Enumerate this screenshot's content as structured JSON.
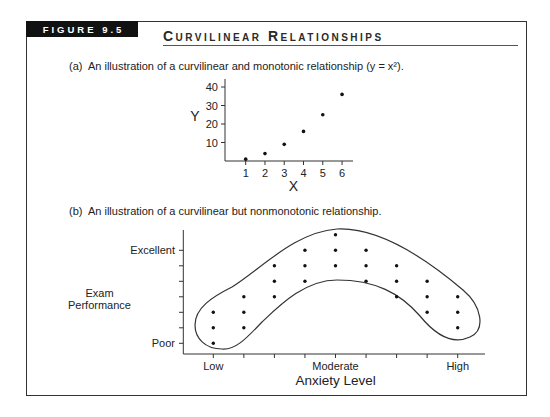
{
  "figure": {
    "label": "FIGURE 9.5",
    "title": "Curvilinear Relationships"
  },
  "captions": {
    "a": "(a)  An illustration of a curvilinear and monotonic relationship (y = x²).",
    "b": "(b)  An illustration of a curvilinear but nonmonotonic relationship."
  },
  "colors": {
    "ink": "#222222",
    "frame_border": "#333333",
    "label_background": "#111111",
    "label_text": "#ffffff",
    "background": "#ffffff"
  },
  "chart_data": [
    {
      "panel": "a",
      "type": "scatter",
      "title": "(a) An illustration of a curvilinear and monotonic relationship (y = x²).",
      "xlabel": "X",
      "ylabel": "Y",
      "x": [
        1,
        2,
        3,
        4,
        5,
        6
      ],
      "y": [
        1,
        4,
        9,
        16,
        25,
        36
      ],
      "xticks": [
        1,
        2,
        3,
        4,
        5,
        6
      ],
      "yticks": [
        10,
        20,
        30,
        40
      ],
      "xlim": [
        0,
        7
      ],
      "ylim": [
        0,
        44
      ],
      "grid": false,
      "legend": null
    },
    {
      "panel": "b",
      "type": "scatter",
      "title": "(b) An illustration of a curvilinear but nonmonotonic relationship.",
      "xlabel": "Anxiety Level",
      "ylabel": [
        "Exam",
        "Performance"
      ],
      "xticks": [
        1,
        2,
        3,
        4,
        5,
        6,
        7,
        8,
        9
      ],
      "xtick_labels": [
        {
          "at": 1,
          "label": "Low"
        },
        {
          "at": 5,
          "label": "Moderate"
        },
        {
          "at": 9,
          "label": "High"
        }
      ],
      "yticks": [
        1,
        2,
        3,
        4,
        5,
        6,
        7
      ],
      "ytick_labels": [
        {
          "at": 7,
          "label": "Excellent"
        },
        {
          "at": 1,
          "label": "Poor"
        }
      ],
      "series": [
        {
          "name": "observations",
          "x": [
            1,
            1,
            1,
            2,
            2,
            2,
            3,
            3,
            3,
            4,
            4,
            4,
            5,
            5,
            5,
            6,
            6,
            6,
            7,
            7,
            7,
            8,
            8,
            8,
            9,
            9,
            9
          ],
          "y": [
            1,
            2,
            3,
            2,
            3,
            4,
            4,
            5,
            6,
            5,
            6,
            7,
            6,
            7,
            8,
            5,
            6,
            7,
            4,
            5,
            6,
            3,
            4,
            5,
            2,
            3,
            4
          ]
        }
      ],
      "annotations": [
        {
          "type": "outline",
          "shape": "inverted-U band enclosing all points"
        }
      ],
      "grid": false,
      "legend": null
    }
  ]
}
